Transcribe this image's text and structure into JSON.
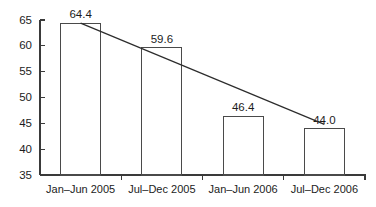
{
  "chart_data": {
    "type": "bar",
    "title": "",
    "subtitle": "",
    "xlabel": "",
    "ylabel": "",
    "categories": [
      "Jan–Jun 2005",
      "Jul–Dec 2005",
      "Jan–Jun 2006",
      "Jul–Dec 2006"
    ],
    "values": [
      64.4,
      59.6,
      46.4,
      44.0
    ],
    "value_labels": [
      "64.4",
      "59.6",
      "46.4",
      "44.0"
    ],
    "ylim": [
      35,
      65
    ],
    "yticks": [
      35,
      40,
      45,
      50,
      55,
      60,
      65
    ],
    "ytick_labels": [
      "35",
      "40",
      "45",
      "50",
      "55",
      "60",
      "65"
    ],
    "grid": false,
    "legend": null,
    "legend_position": "none",
    "series": [
      {
        "name": "",
        "values": [
          64.4,
          59.6,
          46.4,
          44.0
        ]
      }
    ],
    "annotations": [
      {
        "type": "trendline",
        "description": "downward sloping straight line from first bar top toward last bar top",
        "start": {
          "category": "Jan–Jun 2005",
          "value": 64.4
        },
        "end": {
          "category": "Jul–Dec 2006",
          "value": 44.8
        }
      }
    ],
    "colors": {
      "bar_fill": "#ffffff",
      "bar_stroke": "#4a4a4a",
      "axis": "#3a3a3a",
      "trend_line": "#2c2c2c",
      "text": "#1c1c1c",
      "background": "#ffffff"
    }
  }
}
